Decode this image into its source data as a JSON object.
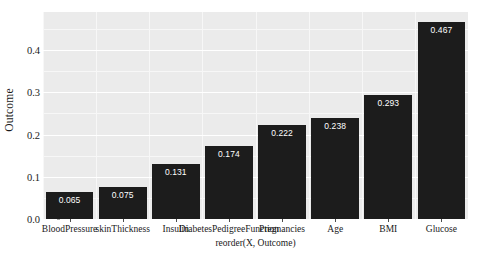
{
  "chart_data": {
    "type": "bar",
    "title": "",
    "subtitle": "",
    "xlabel": "reorder(X, Outcome)",
    "ylabel": "Outcome",
    "categories": [
      "BloodPressure",
      "skinThickness",
      "Insulin",
      "DiabetesPedigreeFunction",
      "Pregnancies",
      "Age",
      "BMI",
      "Glucose"
    ],
    "values": [
      0.065,
      0.075,
      0.131,
      0.174,
      0.222,
      0.238,
      0.293,
      0.467
    ],
    "value_labels": [
      "0.065",
      "0.075",
      "0.131",
      "0.174",
      "0.222",
      "0.238",
      "0.293",
      "0.467"
    ],
    "ylim": [
      0,
      0.49
    ],
    "ytick_values": [
      0.0,
      0.1,
      0.2,
      0.3,
      0.4
    ],
    "ytick_labels": [
      "0.0",
      "0.1",
      "0.2",
      "0.3",
      "0.4"
    ],
    "grid": true,
    "legend": null,
    "bar_color": "#1c1c1c",
    "panel_background": "#ebebeb",
    "gridline_color": "#ffffff",
    "value_label_color": "#ffffff",
    "axis_text_color": "#1a1a1a"
  }
}
